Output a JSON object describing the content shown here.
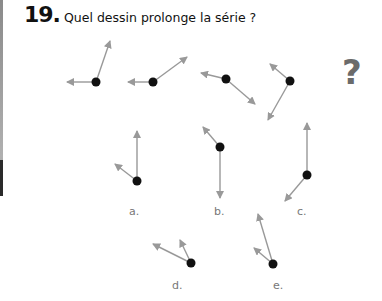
{
  "question": {
    "number": "19.",
    "text": "Quel dessin prolonge la série ?"
  },
  "mystery_symbol": "?",
  "colors": {
    "dot": "#111111",
    "arrow": "#999999",
    "question_mark": "#6b6b6b",
    "label": "#777777"
  },
  "series": [
    {
      "dot": [
        96,
        82
      ],
      "arrows": [
        [
          67,
          82
        ],
        [
          110,
          41
        ]
      ]
    },
    {
      "dot": [
        153,
        82
      ],
      "arrows": [
        [
          128,
          82
        ],
        [
          187,
          57
        ]
      ]
    },
    {
      "dot": [
        226,
        79
      ],
      "arrows": [
        [
          201,
          73
        ],
        [
          255,
          104
        ]
      ]
    },
    {
      "dot": [
        290,
        81
      ],
      "arrows": [
        [
          270,
          64
        ],
        [
          268,
          120
        ]
      ]
    }
  ],
  "options": [
    {
      "label": "a.",
      "label_pos": [
        129,
        205
      ],
      "dot": [
        137,
        181
      ],
      "arrows": [
        [
          137,
          131
        ],
        [
          115,
          164
        ]
      ]
    },
    {
      "label": "b.",
      "label_pos": [
        214,
        205
      ],
      "dot": [
        220,
        147
      ],
      "arrows": [
        [
          203,
          127
        ],
        [
          220,
          198
        ]
      ]
    },
    {
      "label": "c.",
      "label_pos": [
        297,
        205
      ],
      "dot": [
        307,
        175
      ],
      "arrows": [
        [
          307,
          123
        ],
        [
          285,
          201
        ]
      ]
    },
    {
      "label": "d.",
      "label_pos": [
        172,
        279
      ],
      "dot": [
        191,
        263
      ],
      "arrows": [
        [
          153,
          244
        ],
        [
          180,
          240
        ]
      ]
    },
    {
      "label": "e.",
      "label_pos": [
        273,
        279
      ],
      "dot": [
        273,
        264
      ],
      "arrows": [
        [
          258,
          214
        ],
        [
          254,
          248
        ]
      ]
    }
  ]
}
